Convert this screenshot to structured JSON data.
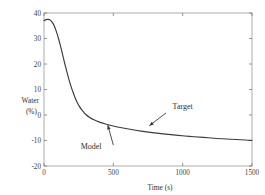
{
  "chart_data": {
    "type": "line",
    "title": "",
    "xlabel": "Time (s)",
    "ylabel": "Water\n(%)",
    "ylabel_line1": "Water",
    "ylabel_line2": "(%)",
    "xlim": [
      0,
      1500
    ],
    "ylim": [
      -20,
      40
    ],
    "xticks": [
      0,
      500,
      1000,
      1500
    ],
    "yticks": [
      40,
      30,
      20,
      10,
      0,
      -10,
      -20
    ],
    "xtick_labels": [
      "0",
      "500",
      "1000",
      "1500"
    ],
    "ytick_labels": [
      "40",
      "30",
      "20",
      "10",
      "0",
      "-10",
      "-20"
    ],
    "grid": false,
    "legend": "none",
    "frame": "box",
    "annotations": [
      {
        "name": "target",
        "label": "Target",
        "text_x": 1000,
        "text_y": 2.5,
        "arrow_from_x": 880,
        "arrow_from_y": 0.8,
        "arrow_to_x": 760,
        "arrow_to_y": -4.2
      },
      {
        "name": "model",
        "label": "Model",
        "text_x": 340,
        "text_y": -13.5,
        "arrow_from_x": 500,
        "arrow_from_y": -11.8,
        "arrow_to_x": 460,
        "arrow_to_y": -4.0
      }
    ],
    "series": [
      {
        "name": "curve",
        "color": "#3b3b3b",
        "x": [
          0,
          15,
          30,
          45,
          60,
          75,
          90,
          105,
          120,
          135,
          150,
          165,
          180,
          195,
          210,
          225,
          240,
          255,
          270,
          285,
          300,
          330,
          360,
          400,
          450,
          500,
          560,
          620,
          700,
          780,
          860,
          950,
          1050,
          1150,
          1250,
          1350,
          1450,
          1500
        ],
        "y": [
          37.0,
          37.4,
          37.5,
          37.2,
          36.3,
          34.8,
          32.6,
          29.9,
          26.8,
          23.5,
          20.1,
          16.9,
          13.9,
          11.2,
          8.8,
          6.7,
          4.9,
          3.4,
          2.2,
          1.2,
          0.3,
          -1.0,
          -1.9,
          -2.8,
          -3.6,
          -4.3,
          -5.0,
          -5.6,
          -6.3,
          -6.9,
          -7.4,
          -7.9,
          -8.4,
          -8.8,
          -9.2,
          -9.5,
          -9.8,
          -10.0
        ]
      }
    ]
  },
  "figure": {
    "background": "#ffffff",
    "axis_color": "#9a9a9a",
    "curve_color": "#3b3b3b",
    "text_color": "#333333"
  }
}
